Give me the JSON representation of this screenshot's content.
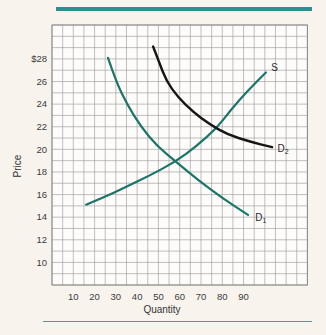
{
  "figure": {
    "top_rule_color": "#2e8f8e",
    "bottom_rule_color": "#60948f",
    "page_bg": "#f9f3ee",
    "plot_bg": "#fefcfa",
    "grid_color": "#9d9d9d",
    "border_color": "#8a8a8a",
    "text_color": "#3b3b3b"
  },
  "chart_data": {
    "type": "line",
    "title": "",
    "xlabel": "Quantity",
    "ylabel": "Price",
    "xlim": [
      0,
      120
    ],
    "ylim": [
      8,
      31
    ],
    "grid": true,
    "x_tick_values": [
      10,
      20,
      30,
      40,
      50,
      60,
      70,
      80,
      90
    ],
    "x_tick_labels": [
      "10",
      "20",
      "30",
      "40",
      "50",
      "60",
      "70",
      "80",
      "90"
    ],
    "y_tick_values": [
      28,
      26,
      24,
      22,
      20,
      18,
      16,
      14,
      12,
      10
    ],
    "y_tick_labels": [
      "$28",
      "26",
      "24",
      "22",
      "20",
      "18",
      "16",
      "14",
      "12",
      "10"
    ],
    "series": [
      {
        "name": "supply",
        "label": "S",
        "label_sub": "",
        "color": "#1b7568",
        "label_pos": [
          103,
          27.2
        ],
        "points": [
          [
            16,
            15.1
          ],
          [
            25,
            15.8
          ],
          [
            34,
            16.6
          ],
          [
            45,
            17.6
          ],
          [
            58,
            18.9
          ],
          [
            68,
            20.3
          ],
          [
            77.5,
            21.9
          ],
          [
            84,
            23.5
          ],
          [
            92,
            25.2
          ],
          [
            100.5,
            26.8
          ]
        ]
      },
      {
        "name": "demand-1",
        "label": "D",
        "label_sub": "1",
        "color": "#1b7568",
        "label_pos": [
          95.5,
          14.0
        ],
        "points": [
          [
            26.3,
            28.1
          ],
          [
            30.1,
            26.0
          ],
          [
            35.2,
            24.0
          ],
          [
            41.8,
            22.0
          ],
          [
            49.3,
            20.3
          ],
          [
            58.3,
            18.9
          ],
          [
            68.6,
            17.3
          ],
          [
            79.9,
            15.7
          ],
          [
            92.1,
            14.2
          ]
        ]
      },
      {
        "name": "demand-2",
        "label": "D",
        "label_sub": "2",
        "color": "#161616",
        "label_pos": [
          106,
          20.1
        ],
        "points": [
          [
            47.5,
            29.1
          ],
          [
            50.3,
            27.7
          ],
          [
            53.6,
            26.1
          ],
          [
            59.2,
            24.6
          ],
          [
            66.3,
            23.3
          ],
          [
            74.2,
            22.2
          ],
          [
            82.7,
            21.3
          ],
          [
            92.6,
            20.7
          ],
          [
            103.4,
            20.2
          ]
        ]
      }
    ]
  }
}
